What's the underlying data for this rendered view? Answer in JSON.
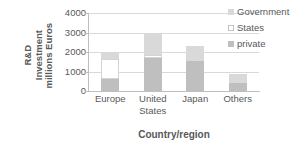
{
  "chart_data": {
    "type": "bar",
    "subtype": "stacked-column",
    "title": "",
    "xlabel": "Country/region",
    "ylabel": "R&D Investment millions Euros",
    "ylabel_lines": [
      "R&D",
      "Investment",
      "millions Euros"
    ],
    "categories": [
      "Europe",
      "United States",
      "Japan",
      "Others"
    ],
    "category_label_lines": [
      [
        "Europe"
      ],
      [
        "United",
        "States"
      ],
      [
        "Japan"
      ],
      [
        "Others"
      ]
    ],
    "series": [
      {
        "name": "private",
        "color": "#bfbfbf",
        "values": [
          620,
          1700,
          1530,
          420
        ]
      },
      {
        "name": "States",
        "color": "#ffffff",
        "values": [
          1010,
          150,
          0,
          0
        ]
      },
      {
        "name": "Government",
        "color": "#d9d9d9",
        "values": [
          320,
          1100,
          770,
          450
        ]
      }
    ],
    "totals": [
      1950,
      2950,
      2300,
      870
    ],
    "ylim": [
      0,
      4000
    ],
    "yticks": [
      0,
      1000,
      2000,
      3000,
      4000
    ],
    "ytick_labels": [
      "0",
      "1000",
      "2000",
      "3000",
      "4000"
    ],
    "grid": true,
    "grid_axis": "y",
    "legend_position": "right",
    "legend_order": [
      "Government",
      "States",
      "private"
    ]
  },
  "legend": {
    "items": [
      {
        "label": "Government",
        "swatch": "government-swatch"
      },
      {
        "label": "States",
        "swatch": "states-swatch"
      },
      {
        "label": "private",
        "swatch": "private-swatch"
      }
    ]
  },
  "colors": {
    "private": "#bfbfbf",
    "states": "#ffffff",
    "government": "#d9d9d9",
    "grid": "#d9d9d9",
    "axis": "#bfbfbf",
    "text": "#595959",
    "background": "#ffffff"
  }
}
